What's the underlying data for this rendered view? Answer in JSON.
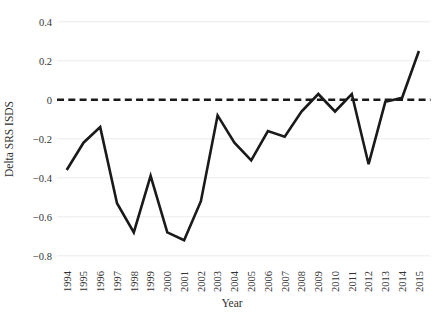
{
  "chart_data": {
    "type": "line",
    "title": "",
    "xlabel": "Year",
    "ylabel": "Delta SRS ISDS",
    "x": [
      1994,
      1995,
      1996,
      1997,
      1998,
      1999,
      2000,
      2001,
      2002,
      2003,
      2004,
      2005,
      2006,
      2007,
      2008,
      2009,
      2010,
      2011,
      2012,
      2013,
      2014,
      2015
    ],
    "xtick_labels": [
      "1994",
      "1995",
      "1996",
      "1997",
      "1998",
      "1999",
      "2000",
      "2001",
      "2002",
      "2003",
      "2004",
      "2005",
      "2006",
      "2007",
      "2008",
      "2009",
      "2010",
      "2011",
      "2012",
      "2013",
      "2014",
      "2015"
    ],
    "series": [
      {
        "name": "Delta SRS ISDS",
        "values": [
          -0.36,
          -0.22,
          -0.14,
          -0.53,
          -0.68,
          -0.39,
          -0.68,
          -0.72,
          -0.52,
          -0.08,
          -0.22,
          -0.31,
          -0.16,
          -0.19,
          -0.06,
          0.03,
          -0.06,
          0.03,
          -0.33,
          -0.01,
          0.01,
          0.25
        ]
      }
    ],
    "ylim": [
      -0.8,
      0.4
    ],
    "xlim": [
      1994,
      2015
    ],
    "yticks": [
      0.4,
      0.2,
      0,
      -0.2,
      -0.4,
      -0.6,
      -0.8
    ],
    "ytick_labels": [
      "0.4",
      "0.2",
      "0",
      "−0.2",
      "−0.4",
      "−0.6",
      "−0.8"
    ],
    "grid": "horizontal-faint",
    "legend": "none",
    "zero_line": "dashed-black",
    "line_color": "#1a1a1a",
    "grid_color": "#ececec",
    "tick_label_color": "#333333",
    "background": "#ffffff"
  }
}
